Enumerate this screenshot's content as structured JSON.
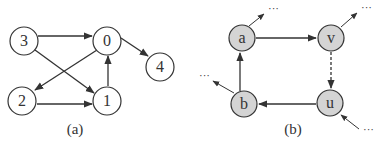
{
  "colors": {
    "stroke": "#333333",
    "fill_a": "#ffffff",
    "fill_b": "#d4d4d4"
  },
  "panels": [
    {
      "caption": "(a)",
      "nodes": [
        {
          "id": "3",
          "label": "3",
          "x": 24,
          "y": 41
        },
        {
          "id": "0",
          "label": "0",
          "x": 107,
          "y": 41
        },
        {
          "id": "4",
          "label": "4",
          "x": 160,
          "y": 67
        },
        {
          "id": "2",
          "label": "2",
          "x": 22,
          "y": 100
        },
        {
          "id": "1",
          "label": "1",
          "x": 107,
          "y": 100
        }
      ],
      "edges": [
        {
          "from": "3",
          "to": "0",
          "style": "solid"
        },
        {
          "from": "3",
          "to": "1",
          "style": "solid"
        },
        {
          "from": "0",
          "to": "2",
          "style": "solid"
        },
        {
          "from": "0",
          "to": "4",
          "style": "solid"
        },
        {
          "from": "2",
          "to": "1",
          "style": "solid"
        },
        {
          "from": "1",
          "to": "0",
          "style": "solid"
        }
      ]
    },
    {
      "caption": "(b)",
      "nodes": [
        {
          "id": "a",
          "label": "a",
          "x": 242,
          "y": 38
        },
        {
          "id": "v",
          "label": "v",
          "x": 331,
          "y": 38
        },
        {
          "id": "b",
          "label": "b",
          "x": 244,
          "y": 105
        },
        {
          "id": "u",
          "label": "u",
          "x": 330,
          "y": 103
        }
      ],
      "edges": [
        {
          "from": "a",
          "to": "v",
          "style": "solid"
        },
        {
          "from": "v",
          "to": "u",
          "style": "dashed"
        },
        {
          "from": "u",
          "to": "b",
          "style": "solid"
        },
        {
          "from": "b",
          "to": "a",
          "style": "solid"
        }
      ],
      "stubs": [
        {
          "node": "a",
          "direction": "out",
          "ellipsis": "···"
        },
        {
          "node": "v",
          "direction": "out",
          "ellipsis": "···"
        },
        {
          "node": "b",
          "direction": "out",
          "ellipsis": "···"
        },
        {
          "node": "u",
          "direction": "in",
          "ellipsis": "···"
        }
      ]
    }
  ]
}
